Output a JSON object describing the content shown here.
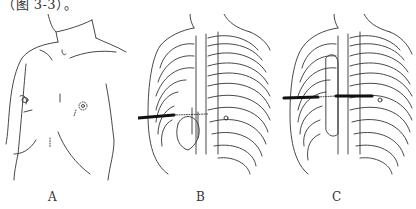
{
  "caption": "（图 3-3）。",
  "panels": [
    {
      "id": "A",
      "label": "A",
      "description": "Front view of chest surface outline"
    },
    {
      "id": "B",
      "label": "B",
      "description": "Rib cage with instrument inserted from right side"
    },
    {
      "id": "C",
      "label": "C",
      "description": "Rib cage with bar placed across sternum"
    }
  ],
  "colors": {
    "line": "#333333",
    "instrument": "#111111",
    "background": "#ffffff"
  }
}
